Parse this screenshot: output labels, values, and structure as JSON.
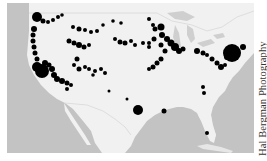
{
  "map": {
    "title": "United States hotspot map",
    "colors": {
      "water": "#c3c3c3",
      "land": "#f1f1f1",
      "border": "#dcdcdc",
      "lakes": "#cfcfcf",
      "markers": "#000000"
    }
  },
  "credit": {
    "text": "Hal Bergman Photography"
  }
}
